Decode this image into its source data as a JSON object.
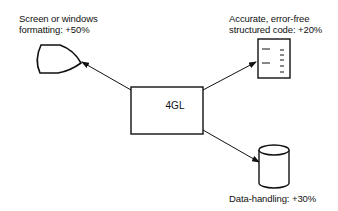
{
  "diagram": {
    "center": {
      "label": "4GL"
    },
    "nodes": [
      {
        "id": "screen",
        "icon": "display-icon",
        "line1": "Screen or windows",
        "line2": "formatting: +50%"
      },
      {
        "id": "code",
        "icon": "document-icon",
        "line1": "Accurate, error-free",
        "line2": "structured code: +20%"
      },
      {
        "id": "data",
        "icon": "database-icon",
        "line1": "Data-handling: +30%"
      }
    ]
  }
}
